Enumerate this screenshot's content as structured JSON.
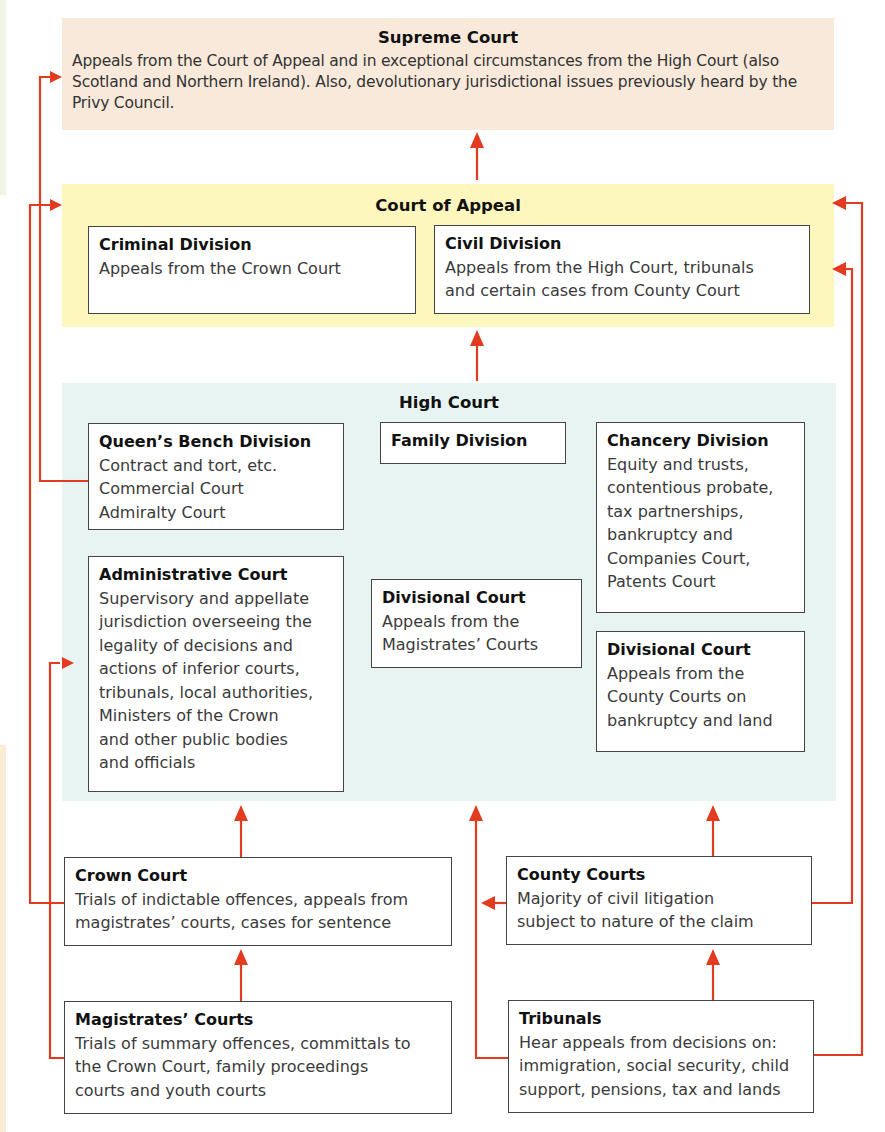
{
  "diagram": {
    "colors": {
      "arrow": "#e33b1f",
      "supreme_bg": "#f8e9da",
      "appeal_bg": "#fdf7bd",
      "high_bg": "#e8f4f2",
      "box_border": "#444444"
    },
    "supreme_court": {
      "title": "Supreme Court",
      "description": "Appeals from the Court of Appeal and in exceptional circumstances from the High Court (also Scotland and Northern Ireland). Also, devolutionary jurisdictional issues previously heard by the Privy Council."
    },
    "court_of_appeal": {
      "title": "Court of Appeal",
      "divisions": [
        {
          "title": "Criminal Division",
          "body": "Appeals from the Crown Court"
        },
        {
          "title": "Civil Division",
          "body": "Appeals from the High Court, tribunals\nand certain cases from County Court"
        }
      ]
    },
    "high_court": {
      "title": "High Court",
      "queens_bench": {
        "title": "Queen’s Bench Division",
        "body": "Contract and tort, etc.\nCommercial Court\nAdmiralty Court"
      },
      "family": {
        "title": "Family Division"
      },
      "chancery": {
        "title": "Chancery Division",
        "body": "Equity and trusts,\ncontentious probate,\ntax partnerships,\nbankruptcy and\nCompanies Court,\nPatents Court"
      },
      "administrative": {
        "title": "Administrative Court",
        "body": "Supervisory and appellate\njurisdiction overseeing the\nlegality of decisions and\nactions of inferior courts,\ntribunals, local authorities,\nMinisters of the Crown\nand other public bodies\nand officials"
      },
      "divisional_magistrates": {
        "title": "Divisional Court",
        "body": "Appeals from the\nMagistrates’ Courts"
      },
      "divisional_county": {
        "title": "Divisional Court",
        "body": "Appeals from the\nCounty Courts on\nbankruptcy and land"
      }
    },
    "crown_court": {
      "title": "Crown Court",
      "body": "Trials of indictable offences, appeals from\nmagistrates’ courts, cases for sentence"
    },
    "county_courts": {
      "title": "County Courts",
      "body": "Majority of civil litigation\nsubject to nature of the claim"
    },
    "magistrates_courts": {
      "title": "Magistrates’ Courts",
      "body": "Trials of summary offences, committals to\nthe Crown Court, family proceedings\ncourts and youth courts"
    },
    "tribunals": {
      "title": "Tribunals",
      "body": "Hear appeals from decisions on:\nimmigration, social security, child\nsupport, pensions, tax and lands"
    }
  }
}
